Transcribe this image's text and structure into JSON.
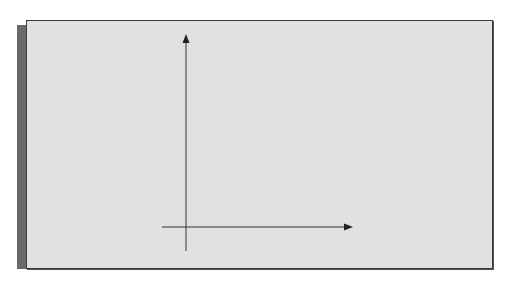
{
  "figure": {
    "title": "",
    "axes": {
      "x_label": "x",
      "y_label": "y",
      "x_ticks": [
        {
          "base": "x",
          "sub": "0",
          "px": 213
        },
        {
          "base": "x",
          "sub": "1",
          "px": 239.5
        },
        {
          "base": "x",
          "sub": "2",
          "px": 266
        },
        {
          "base": "x",
          "sub": "3",
          "px": 292
        },
        {
          "base": "x",
          "sub": "4",
          "px": 318
        }
      ],
      "y_ticks": [
        {
          "base": "y",
          "sub": "0",
          "py": 200
        },
        {
          "base": "y",
          "sub": "1",
          "py": 173.5
        },
        {
          "base": "y",
          "sub": "2",
          "py": 147
        },
        {
          "base": "y",
          "sub": "3",
          "py": 120.5
        },
        {
          "base": "y",
          "sub": "4",
          "py": 94
        },
        {
          "base": "y",
          "sub": "5",
          "py": 68
        }
      ]
    },
    "grid": {
      "cols": [
        213,
        239.5,
        266,
        292,
        318
      ],
      "rows": [
        68,
        94,
        120.5,
        147,
        173.5,
        200
      ]
    },
    "points": [
      {
        "name": "P",
        "sub": "1",
        "xi": 1,
        "yi": 4
      },
      {
        "name": "P",
        "sub": "2",
        "xi": 2,
        "yi": 4
      },
      {
        "name": "P",
        "sub": "3",
        "xi": 3,
        "yi": 4
      },
      {
        "name": "P",
        "sub": "4",
        "xi": 1,
        "yi": 3
      },
      {
        "name": "P",
        "sub": "5",
        "xi": 2,
        "yi": 3
      },
      {
        "name": "P",
        "sub": "6",
        "xi": 3,
        "yi": 3
      },
      {
        "name": "P",
        "sub": "7",
        "xi": 1,
        "yi": 2
      },
      {
        "name": "P",
        "sub": "8",
        "xi": 2,
        "yi": 2
      },
      {
        "name": "P",
        "sub": "9",
        "xi": 3,
        "yi": 2
      },
      {
        "name": "P",
        "sub": "10",
        "xi": 1,
        "yi": 1
      },
      {
        "name": "P",
        "sub": "11",
        "xi": 2,
        "yi": 1
      },
      {
        "name": "P",
        "sub": "12",
        "xi": 3,
        "yi": 1
      }
    ],
    "colors": {
      "panel_bg": "#e1e1e1",
      "line": "#333333",
      "shadow": "#6a6a6a"
    }
  }
}
